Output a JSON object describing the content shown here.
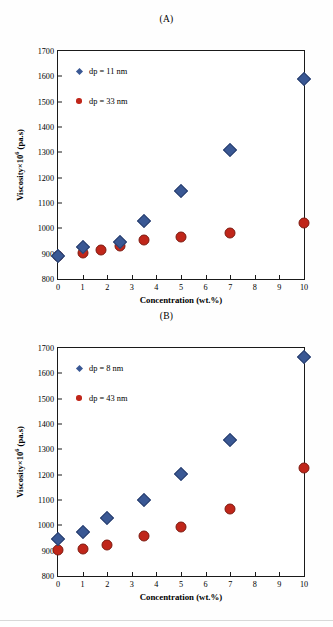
{
  "figure": {
    "background": "#ffffff",
    "marker_blue": "#3a5894",
    "marker_red": "#c0261a"
  },
  "panels": [
    {
      "id": "A",
      "title": "(A)",
      "chart_data": {
        "type": "scatter",
        "title": "(A)",
        "xlabel": "Concentration (wt.%)",
        "ylabel": "Viscosity×10⁶ (pa.s)",
        "xlim": [
          0,
          10
        ],
        "ylim": [
          800,
          1700
        ],
        "xticks": [
          "0",
          "1",
          "2",
          "3",
          "4",
          "5",
          "6",
          "7",
          "8",
          "9",
          "10"
        ],
        "yticks": [
          "800",
          "900",
          "1000",
          "1100",
          "1200",
          "1300",
          "1400",
          "1500",
          "1600",
          "1700"
        ],
        "grid": false,
        "legend_position": "upper-left",
        "series": [
          {
            "name": "dp = 11 nm",
            "marker": "diamond",
            "color": "#3a5894",
            "x": [
              0,
              1,
              2.5,
              3.5,
              5,
              7,
              10
            ],
            "y": [
              890,
              925,
              948,
              1028,
              1147,
              1308,
              1590
            ]
          },
          {
            "name": "dp = 33 nm",
            "marker": "circle",
            "color": "#c0261a",
            "x": [
              0,
              1,
              1.75,
              2.5,
              3.5,
              5,
              7,
              10
            ],
            "y": [
              890,
              902,
              916,
              932,
              953,
              965,
              981,
              1020
            ]
          }
        ]
      }
    },
    {
      "id": "B",
      "title": "(B)",
      "chart_data": {
        "type": "scatter",
        "title": "(B)",
        "xlabel": "Concentration (wt.%)",
        "ylabel": "Viscosity×10⁶ (pa.s)",
        "xlim": [
          0,
          10
        ],
        "ylim": [
          800,
          1700
        ],
        "xticks": [
          "0",
          "1",
          "2",
          "3",
          "4",
          "5",
          "6",
          "7",
          "8",
          "9",
          "10"
        ],
        "yticks": [
          "800",
          "900",
          "1000",
          "1100",
          "1200",
          "1300",
          "1400",
          "1500",
          "1600",
          "1700"
        ],
        "grid": false,
        "legend_position": "upper-left",
        "series": [
          {
            "name": "dp = 8 nm",
            "marker": "diamond",
            "color": "#3a5894",
            "x": [
              0,
              1,
              2,
              3.5,
              5,
              7,
              10
            ],
            "y": [
              945,
              975,
              1028,
              1100,
              1203,
              1335,
              1665
            ]
          },
          {
            "name": "dp = 43 nm",
            "marker": "circle",
            "color": "#c0261a",
            "x": [
              0,
              1,
              2,
              3.5,
              5,
              7,
              10
            ],
            "y": [
              903,
              908,
              924,
              956,
              995,
              1064,
              1227
            ]
          }
        ]
      }
    }
  ]
}
